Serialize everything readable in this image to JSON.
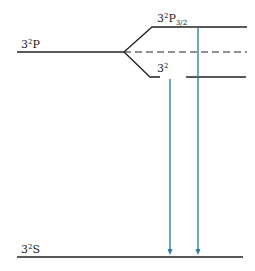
{
  "diagram": {
    "levels": [
      {
        "id": "3P",
        "label_main": "3",
        "label_sup": "2",
        "label_rest": "P",
        "label_sub": ""
      },
      {
        "id": "3P32",
        "label_main": "3",
        "label_sup": "2",
        "label_rest": "P",
        "label_sub": "3/2"
      },
      {
        "id": "3P12",
        "label_main": "3",
        "label_sup": "2",
        "label_rest": "",
        "label_sub": ""
      },
      {
        "id": "3S",
        "label_main": "3",
        "label_sup": "2",
        "label_rest": "S",
        "label_sub": ""
      }
    ],
    "transitions": [
      {
        "from": "3P12",
        "to": "3S",
        "color": "#2a7fa6"
      },
      {
        "from": "3P32",
        "to": "3S",
        "color": "#2a7fa6"
      }
    ],
    "colors": {
      "line": "#222222",
      "transition": "#2a7fa6"
    }
  }
}
